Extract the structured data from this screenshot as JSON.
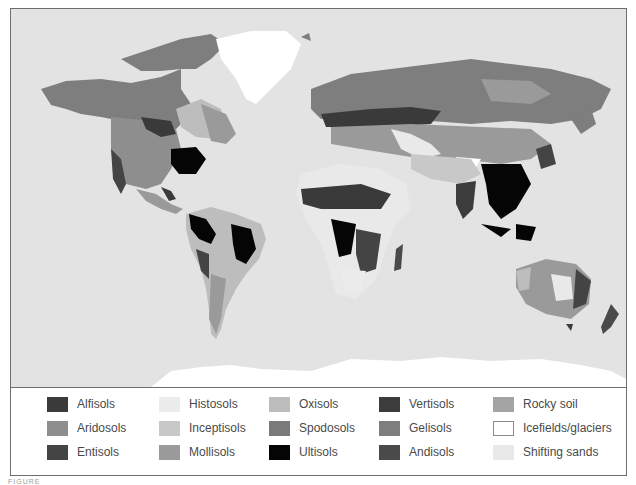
{
  "figure": {
    "caption_fragment": "FIGURE"
  },
  "map": {
    "title": "World soil orders map",
    "ocean_color": "#e3e3e3"
  },
  "legend": {
    "items": [
      {
        "label": "Alfisols",
        "color": "#3a3a3a",
        "col": 0,
        "row": 0
      },
      {
        "label": "Aridosols",
        "color": "#8e8e8e",
        "col": 0,
        "row": 1
      },
      {
        "label": "Entisols",
        "color": "#444444",
        "col": 0,
        "row": 2
      },
      {
        "label": "Histosols",
        "color": "#ececec",
        "col": 1,
        "row": 0
      },
      {
        "label": "Inceptisols",
        "color": "#c8c8c8",
        "col": 1,
        "row": 1
      },
      {
        "label": "Mollisols",
        "color": "#9a9a9a",
        "col": 1,
        "row": 2
      },
      {
        "label": "Oxisols",
        "color": "#bdbdbd",
        "col": 2,
        "row": 0
      },
      {
        "label": "Spodosols",
        "color": "#7a7a7a",
        "col": 2,
        "row": 1
      },
      {
        "label": "Ultisols",
        "color": "#050505",
        "col": 2,
        "row": 2
      },
      {
        "label": "Vertisols",
        "color": "#3c3c3c",
        "col": 3,
        "row": 0
      },
      {
        "label": "Gelisols",
        "color": "#7e7e7e",
        "col": 3,
        "row": 1
      },
      {
        "label": "Andisols",
        "color": "#4a4a4a",
        "col": 3,
        "row": 2
      },
      {
        "label": "Rocky soil",
        "color": "#a4a4a4",
        "col": 4,
        "row": 0
      },
      {
        "label": "Icefields/glaciers",
        "color": "#ffffff",
        "col": 4,
        "row": 1,
        "outlined": true
      },
      {
        "label": "Shifting sands",
        "color": "#e9e9e9",
        "col": 4,
        "row": 2
      }
    ]
  }
}
